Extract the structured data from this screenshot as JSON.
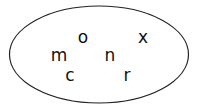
{
  "diagram": {
    "type": "set",
    "elements": [
      {
        "label": "o"
      },
      {
        "label": "x"
      },
      {
        "label": "m"
      },
      {
        "label": "n"
      },
      {
        "label": "c"
      },
      {
        "label": "r"
      }
    ],
    "colors": {
      "stroke": "#222222",
      "text": "#111111",
      "background": "#ffffff"
    }
  }
}
